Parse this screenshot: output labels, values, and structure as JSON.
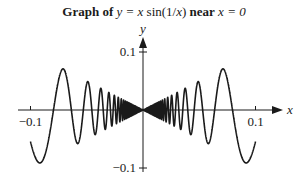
{
  "chart_data": {
    "type": "line",
    "title": "Graph of y = x sin(1/x) near x = 0",
    "title_parts": {
      "prefix": "Graph of",
      "equation": "y = x",
      "func": "sin(1/",
      "func_var": "x",
      "func_close": ")",
      "near": "near",
      "point": "x = 0"
    },
    "function": "y = x*sin(1/x)",
    "xlabel": "x",
    "ylabel": "y",
    "xlim": [
      -0.115,
      0.125
    ],
    "ylim": [
      -0.115,
      0.125
    ],
    "x_domain": [
      -0.1,
      0.1
    ],
    "x_ticks": [
      {
        "value": -0.1,
        "label": "−0.1"
      },
      {
        "value": 0.1,
        "label": "0.1"
      }
    ],
    "y_ticks": [
      {
        "value": 0.1,
        "label": "0.1"
      },
      {
        "value": -0.1,
        "label": "−0.1"
      }
    ],
    "series": [
      {
        "name": "x sin(1/x)",
        "color": "#1a1a1a"
      }
    ],
    "grid": false,
    "legend": "none"
  }
}
